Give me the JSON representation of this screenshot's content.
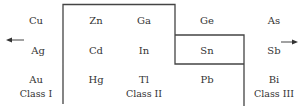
{
  "elements": {
    "cu": "Cu",
    "ag": "Ag",
    "au": "Au",
    "zn": "Zn",
    "cd": "Cd",
    "hg": "Hg",
    "ga": "Ga",
    "in": "In",
    "tl": "Tl",
    "ge": "Ge",
    "sn": "Sn",
    "pb": "Pb",
    "as": "As",
    "sb": "Sb",
    "bi": "Bi"
  },
  "classes": {
    "class1": "Class I",
    "class2": "Class II",
    "class3": "Class III"
  },
  "arrows": {
    "left": "left-arrow",
    "right": "right-arrow"
  },
  "colors": {
    "line": "#444444",
    "text": "#333333"
  }
}
